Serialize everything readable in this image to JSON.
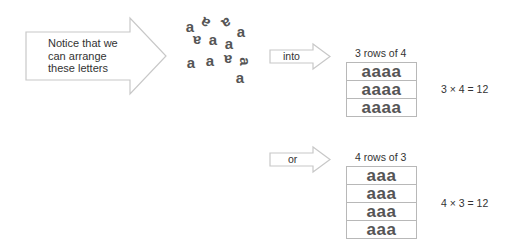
{
  "intro_arrow": {
    "lines": [
      "Notice that we",
      "can arrange",
      "these letters"
    ]
  },
  "scattered_letters": {
    "glyph": "a",
    "count": 12,
    "items": [
      {
        "char": "a",
        "x": 184,
        "y": 19,
        "rotate": 0
      },
      {
        "char": "a",
        "x": 199,
        "y": 16,
        "rotate": -150
      },
      {
        "char": "a",
        "x": 221,
        "y": 16,
        "rotate": 150
      },
      {
        "char": "a",
        "x": 235,
        "y": 24,
        "rotate": 0
      },
      {
        "char": "a",
        "x": 191,
        "y": 34,
        "rotate": 180
      },
      {
        "char": "a",
        "x": 207,
        "y": 32,
        "rotate": 0
      },
      {
        "char": "a",
        "x": 223,
        "y": 36,
        "rotate": 0
      },
      {
        "char": "a",
        "x": 185,
        "y": 55,
        "rotate": 0
      },
      {
        "char": "a",
        "x": 204,
        "y": 53,
        "rotate": 0
      },
      {
        "char": "a",
        "x": 222,
        "y": 53,
        "rotate": 180
      },
      {
        "char": "a",
        "x": 239,
        "y": 54,
        "rotate": 90
      },
      {
        "char": "a",
        "x": 234,
        "y": 70,
        "rotate": 0
      }
    ]
  },
  "arrangement_1": {
    "connector_label": "into",
    "title": "3 rows of 4",
    "rows": [
      "aaaa",
      "aaaa",
      "aaaa"
    ],
    "equation": "3 × 4 = 12"
  },
  "arrangement_2": {
    "connector_label": "or",
    "title": "4 rows of 3",
    "rows": [
      "aaa",
      "aaa",
      "aaa",
      "aaa"
    ],
    "equation": "4 × 3 = 12"
  },
  "colors": {
    "arrow_stroke": "#c8c8c8",
    "grid_border": "#b8b8b8",
    "letters": "#555555",
    "text": "#333333"
  }
}
